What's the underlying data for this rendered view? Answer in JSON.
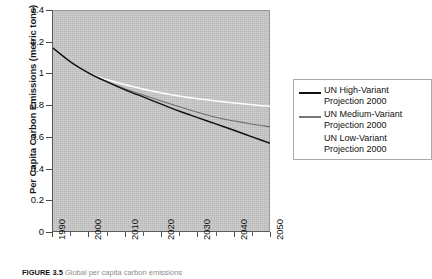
{
  "figure": {
    "caption_label": "FIGURE 3.5",
    "caption_text": "Global per capita carbon emissions"
  },
  "chart_data": {
    "type": "line",
    "title": "",
    "xlabel": "",
    "ylabel": "Per Capita Carbon Emissions (metric tons)",
    "xlim": [
      1990,
      2050
    ],
    "ylim": [
      0,
      1.4
    ],
    "grid": false,
    "legend_position": "right",
    "x_ticks": [
      1990,
      2000,
      2010,
      2020,
      2030,
      2040,
      2050
    ],
    "x_tick_labels": [
      "1990",
      "2000",
      "2010",
      "2020",
      "2030",
      "2040",
      "2050"
    ],
    "x_minor_ticks": [
      1995,
      2005,
      2015,
      2025,
      2035,
      2045
    ],
    "y_ticks": [
      0,
      0.2,
      0.4,
      0.6,
      0.8,
      1,
      1.2,
      1.4
    ],
    "y_tick_labels": [
      "0",
      "0.2",
      "0.4",
      "0.6",
      "0.8",
      "1",
      "1.2",
      "1.4"
    ],
    "x": [
      1990,
      1995,
      2000,
      2005,
      2010,
      2015,
      2020,
      2025,
      2030,
      2035,
      2040,
      2045,
      2050
    ],
    "series": [
      {
        "name": "UN High-Variant Projection 2000",
        "color": "#111111",
        "values": [
          1.16,
          1.07,
          1.0,
          0.945,
          0.895,
          0.85,
          0.805,
          0.76,
          0.72,
          0.68,
          0.64,
          0.598,
          0.558
        ]
      },
      {
        "name": "UN Medium-Variant Projection 2000",
        "color": "#6e6e6e",
        "values": [
          1.16,
          1.07,
          1.0,
          0.948,
          0.902,
          0.862,
          0.824,
          0.788,
          0.754,
          0.722,
          0.7,
          0.68,
          0.662
        ]
      },
      {
        "name": "UN Low-Variant Projection 2000",
        "color": "#ffffff",
        "values": [
          1.16,
          1.07,
          1.0,
          0.96,
          0.928,
          0.9,
          0.876,
          0.856,
          0.84,
          0.826,
          0.814,
          0.802,
          0.792
        ]
      }
    ]
  },
  "legend": {
    "items": [
      {
        "label": "UN High-Variant\nProjection 2000",
        "color": "#111111"
      },
      {
        "label": "UN Medium-Variant\nProjection 2000",
        "color": "#777777"
      },
      {
        "label": "UN Low-Variant\nProjection 2000",
        "color": "#ffffff"
      }
    ]
  }
}
